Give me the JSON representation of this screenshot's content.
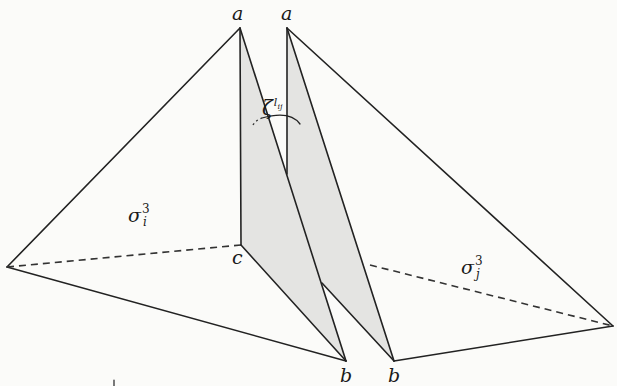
{
  "figure": {
    "type": "geometric diagram of two 3-simplices sharing an edge ab",
    "colors": {
      "line": "#222222",
      "shade": "#e4e4e2",
      "background": "#fbfbf9"
    },
    "vertices": {
      "a_left": {
        "label": "a",
        "x": 240,
        "y": 28
      },
      "a_right": {
        "label": "a",
        "x": 287,
        "y": 28
      },
      "c": {
        "label": "c",
        "x": 241,
        "y": 245
      },
      "b_left": {
        "label": "b",
        "x": 346,
        "y": 361
      },
      "b_right": {
        "label": "b",
        "x": 394,
        "y": 361
      },
      "left_outer": {
        "x": 7,
        "y": 267
      },
      "right_outer": {
        "x": 613,
        "y": 326
      }
    },
    "labels": {
      "a_left": "a",
      "a_right": "a",
      "c": "c",
      "b_left": "b",
      "b_right": "b",
      "sigma_i": {
        "base": "σ",
        "sup": "3",
        "sub": "i"
      },
      "sigma_j": {
        "base": "σ",
        "sup": "3",
        "sub": "j"
      },
      "angle": {
        "base": "ζ",
        "sup": "l",
        "sub": "ij"
      }
    }
  }
}
